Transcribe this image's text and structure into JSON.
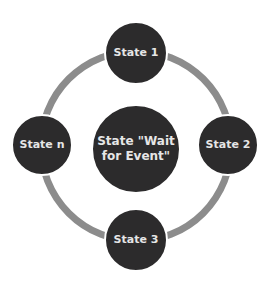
{
  "diagram": {
    "type": "state-cycle",
    "colors": {
      "node_fill": "#2c2b2c",
      "node_text": "#e6e6e6",
      "ring": "#8c8c8c",
      "background": "#ffffff"
    },
    "center": {
      "label": "State \"Wait for Event\"",
      "line1": "State \"Wait",
      "line2": "for Event\""
    },
    "nodes": [
      {
        "id": "top",
        "label": "State 1"
      },
      {
        "id": "right",
        "label": "State 2"
      },
      {
        "id": "bottom",
        "label": "State 3"
      },
      {
        "id": "left",
        "label": "State n"
      }
    ]
  }
}
